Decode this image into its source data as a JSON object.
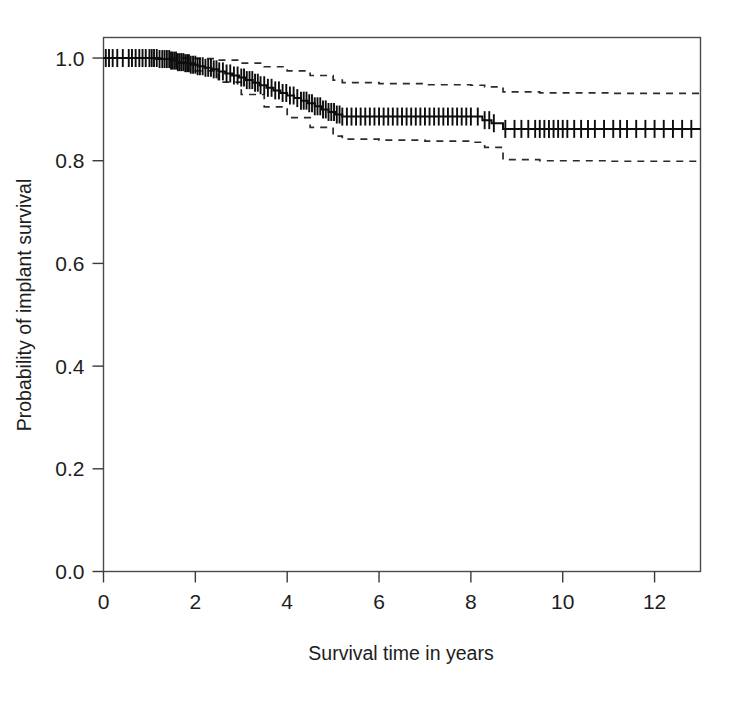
{
  "chart_data": {
    "type": "line",
    "plot_kind": "kaplan-meier-survival-curve",
    "title": "",
    "xlabel": "Survival time in years",
    "ylabel": "Probability of implant survival",
    "xlim": [
      0,
      13
    ],
    "ylim": [
      0.0,
      1.04
    ],
    "grid": false,
    "legend": "none",
    "xticks": [
      0,
      2,
      4,
      6,
      8,
      10,
      12
    ],
    "xtick_labels": [
      "0",
      "2",
      "4",
      "6",
      "8",
      "10",
      "12"
    ],
    "yticks": [
      0.0,
      0.2,
      0.4,
      0.6,
      0.8,
      1.0
    ],
    "ytick_labels": [
      "0.0",
      "0.2",
      "0.4",
      "0.6",
      "0.8",
      "1.0"
    ],
    "series": [
      {
        "name": "Implant survival (Kaplan-Meier estimate)",
        "style": "solid-step",
        "color": "#0d0d0d",
        "x": [
          0.0,
          0.9,
          1.2,
          1.45,
          1.6,
          1.75,
          1.9,
          2.05,
          2.2,
          2.35,
          2.5,
          2.65,
          2.8,
          2.95,
          3.1,
          3.25,
          3.4,
          3.55,
          3.7,
          3.85,
          4.0,
          4.15,
          4.3,
          4.45,
          4.6,
          4.75,
          4.9,
          5.05,
          5.2,
          8.0,
          8.25,
          8.45,
          8.7,
          13.0
        ],
        "y": [
          1.0,
          1.0,
          0.998,
          0.995,
          0.992,
          0.99,
          0.987,
          0.984,
          0.981,
          0.978,
          0.974,
          0.97,
          0.966,
          0.962,
          0.957,
          0.952,
          0.947,
          0.942,
          0.937,
          0.932,
          0.927,
          0.922,
          0.917,
          0.912,
          0.906,
          0.9,
          0.895,
          0.89,
          0.886,
          0.886,
          0.879,
          0.873,
          0.862,
          0.862
        ]
      },
      {
        "name": "Upper 95% confidence limit",
        "style": "dashed",
        "color": "#2b2b2b",
        "x": [
          0.0,
          1.0,
          1.5,
          2.0,
          2.5,
          3.0,
          3.5,
          4.0,
          4.5,
          5.0,
          5.2,
          6.0,
          7.0,
          8.0,
          8.3,
          8.7,
          9.5,
          11.0,
          13.0
        ],
        "y": [
          1.0,
          1.0,
          1.0,
          0.999,
          0.996,
          0.99,
          0.983,
          0.975,
          0.966,
          0.957,
          0.952,
          0.95,
          0.948,
          0.947,
          0.944,
          0.934,
          0.932,
          0.931,
          0.93
        ]
      },
      {
        "name": "Lower 95% confidence limit",
        "style": "dashed",
        "color": "#2b2b2b",
        "x": [
          0.0,
          1.0,
          1.5,
          2.0,
          2.5,
          3.0,
          3.5,
          4.0,
          4.5,
          5.0,
          5.2,
          6.0,
          7.0,
          8.0,
          8.3,
          8.7,
          9.5,
          11.0,
          13.0
        ],
        "y": [
          1.0,
          0.998,
          0.99,
          0.975,
          0.953,
          0.929,
          0.905,
          0.884,
          0.865,
          0.848,
          0.842,
          0.84,
          0.838,
          0.836,
          0.826,
          0.802,
          0.8,
          0.799,
          0.798
        ]
      }
    ],
    "censoring_marks": {
      "symbol": "+",
      "description": "vertical tick marks on the survival curve indicating censored observations",
      "x": [
        0.05,
        0.12,
        0.2,
        0.3,
        0.42,
        0.55,
        0.62,
        0.7,
        0.78,
        0.85,
        0.92,
        1.0,
        1.05,
        1.1,
        1.16,
        1.22,
        1.28,
        1.33,
        1.38,
        1.43,
        1.47,
        1.5,
        1.54,
        1.58,
        1.62,
        1.66,
        1.7,
        1.74,
        1.78,
        1.82,
        1.86,
        1.9,
        1.95,
        2.0,
        2.05,
        2.1,
        2.16,
        2.22,
        2.28,
        2.34,
        2.4,
        2.46,
        2.52,
        2.6,
        2.68,
        2.76,
        2.84,
        2.92,
        3.0,
        3.06,
        3.12,
        3.18,
        3.24,
        3.3,
        3.36,
        3.42,
        3.5,
        3.58,
        3.66,
        3.74,
        3.82,
        3.9,
        3.98,
        4.06,
        4.14,
        4.22,
        4.3,
        4.36,
        4.42,
        4.48,
        4.54,
        4.6,
        4.66,
        4.72,
        4.78,
        4.84,
        4.9,
        4.96,
        5.02,
        5.08,
        5.14,
        5.2,
        5.3,
        5.4,
        5.5,
        5.6,
        5.7,
        5.8,
        5.9,
        6.0,
        6.1,
        6.2,
        6.3,
        6.4,
        6.5,
        6.6,
        6.7,
        6.8,
        6.9,
        7.0,
        7.1,
        7.2,
        7.3,
        7.4,
        7.5,
        7.6,
        7.7,
        7.8,
        7.9,
        8.0,
        8.15,
        8.3,
        8.4,
        8.5,
        8.75,
        8.95,
        9.1,
        9.25,
        9.4,
        9.5,
        9.6,
        9.7,
        9.8,
        9.9,
        10.0,
        10.1,
        10.25,
        10.4,
        10.55,
        10.7,
        10.9,
        11.1,
        11.25,
        11.4,
        11.6,
        11.8,
        12.0,
        12.2,
        12.4,
        12.6,
        12.8
      ]
    }
  },
  "axes": {
    "x_title": "Survival time in years",
    "y_title": "Probability of implant survival"
  }
}
